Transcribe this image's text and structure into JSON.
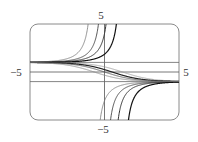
{
  "chart_data": {
    "type": "line",
    "title": "",
    "xlabel": "",
    "ylabel": "",
    "xlim": [
      -5,
      5
    ],
    "ylim": [
      -5,
      5
    ],
    "grid": false,
    "legend": "none",
    "tick_labels": {
      "x_left": "−5",
      "x_right": "5",
      "y_top": "5",
      "y_bottom": "−5"
    },
    "reference_lines": [
      {
        "orientation": "horizontal",
        "y": 1
      },
      {
        "orientation": "horizontal",
        "y": -1
      }
    ],
    "function": "f(x) = (1 - c*e^x) / (1 + c*e^x)",
    "family_parameter": "c",
    "series": [
      {
        "name": "c=-2",
        "c": -2,
        "stroke": "#777777",
        "width": 0.8
      },
      {
        "name": "c=-1",
        "c": -1,
        "stroke": "#444444",
        "width": 0.9
      },
      {
        "name": "c=-0.6",
        "c": -0.6,
        "stroke": "#333333",
        "width": 1.0
      },
      {
        "name": "c=-0.3",
        "c": -0.3,
        "stroke": "#111111",
        "width": 1.2
      },
      {
        "name": "c=0.3",
        "c": 0.3,
        "stroke": "#999999",
        "width": 0.8
      },
      {
        "name": "c=0.6",
        "c": 0.6,
        "stroke": "#222222",
        "width": 1.2
      },
      {
        "name": "c=1",
        "c": 1,
        "stroke": "#555555",
        "width": 0.9
      },
      {
        "name": "c=2",
        "c": 2,
        "stroke": "#888888",
        "width": 0.8
      }
    ]
  },
  "colors": {
    "frame": "#8a8a8a",
    "axis": "#555555",
    "asymptote": "#666666"
  }
}
